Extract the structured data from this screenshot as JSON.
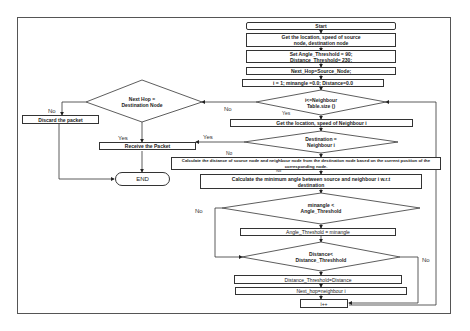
{
  "diagram": {
    "nodes": {
      "start": "Start",
      "get_location": "Get the location, speed of source node, destination node",
      "set_thresholds": "Set Angle_Threshold = 90; Distance_Threshold= 230;",
      "next_hop_init": "Next_Hop=Source_Node;",
      "init_vars": "i = 1; minangle =0.0; Distance=0.0",
      "loop_cond": "i<=Neighbour Table.size ()",
      "next_hop_dest": "Next Hop = Destination Node",
      "discard": "Discard the packet",
      "get_neighbour": "Get the location, speed of Neighbour i",
      "dest_eq_neighbour": "Destination = Neighbour i",
      "receive": "Receive the Packet",
      "end": "END",
      "calc_distance": "Calculate the distance of source node and neighbour node from the destination node based on the current position of the corresponding node.",
      "calc_angle": "Calculate the minimum angle between source and neighbour i w.r.t destination",
      "angle_cond": "minangle < Angle_Threshold",
      "set_angle": "Angle_Threshold = minangle",
      "distance_cond": "Distance< Distance_Threshhold",
      "set_distance": "Distance_Threshold=Distance",
      "set_next_hop": "Next_hop=neighbour i",
      "increment": "i++"
    },
    "edge_labels": {
      "no": "No",
      "yes": "Yes"
    }
  }
}
